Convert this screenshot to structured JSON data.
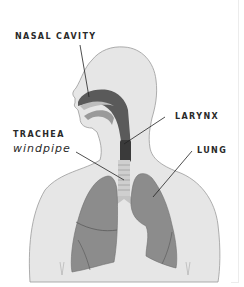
{
  "diagram": {
    "labels": {
      "nasal_cavity": "NASAL CAVITY",
      "larynx": "LARYNX",
      "trachea": "TRACHEA",
      "trachea_common": "windpipe",
      "lung": "LUNG"
    },
    "colors": {
      "body_fill": "#e6e6e6",
      "body_outline": "#9a9a9a",
      "airway_dark": "#4a4a4a",
      "lung_fill": "#8c8c8c",
      "trachea_fill": "#c8c8c8",
      "leader_line": "#222222",
      "label_text": "#2a2a2a"
    }
  }
}
